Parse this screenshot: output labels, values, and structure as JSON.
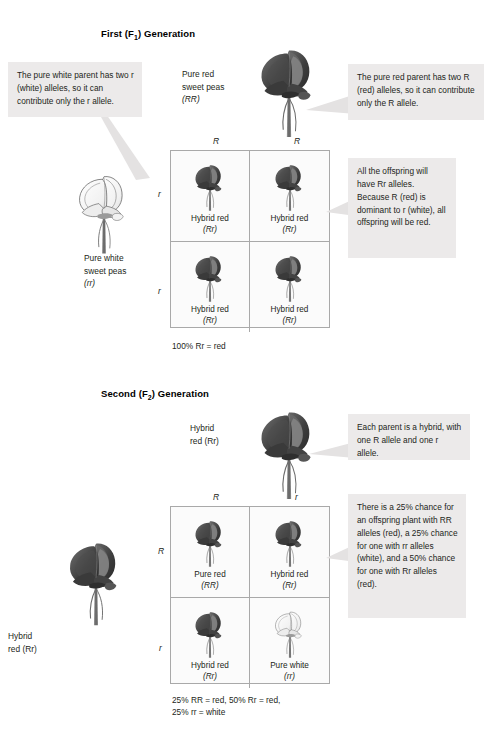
{
  "generations": [
    {
      "id": "f1",
      "title_prefix": "First (F",
      "title_sub": "1",
      "title_suffix": ") Generation",
      "title_full": "First (F1) Generation",
      "top_parent_label_lines": [
        "Pure red",
        "sweet peas",
        "(RR)"
      ],
      "left_parent_label_lines": [
        "Pure white",
        "sweet peas",
        "(rr)"
      ],
      "column_headers": [
        "R",
        "R"
      ],
      "row_headers": [
        "r",
        "r"
      ],
      "cells": [
        {
          "name": "Hybrid red",
          "genotype": "(Rr)",
          "color": "red"
        },
        {
          "name": "Hybrid red",
          "genotype": "(Rr)",
          "color": "red"
        },
        {
          "name": "Hybrid red",
          "genotype": "(Rr)",
          "color": "red"
        },
        {
          "name": "Hybrid red",
          "genotype": "(Rr)",
          "color": "red"
        }
      ],
      "result": "100% Rr = red",
      "callouts": [
        {
          "name": "left-callout",
          "text": "The pure white parent has two r (white) alleles, so it can contribute only the r allele."
        },
        {
          "name": "right-callout",
          "text": "The pure red parent has two R (red) alleles, so it can contribute only the R allele."
        },
        {
          "name": "offspring-callout",
          "text": "All the offspring will have Rr alleles. Because R (red) is dominant to r (white), all offspring will be red."
        }
      ]
    },
    {
      "id": "f2",
      "title_prefix": "Second (F",
      "title_sub": "2",
      "title_suffix": ") Generation",
      "title_full": "Second (F2) Generation",
      "top_parent_label_lines": [
        "Hybrid",
        "red (Rr)"
      ],
      "left_parent_label_lines": [
        "Hybrid",
        "red (Rr)"
      ],
      "column_headers": [
        "R",
        "r"
      ],
      "row_headers": [
        "R",
        "r"
      ],
      "cells": [
        {
          "name": "Pure red",
          "genotype": "(RR)",
          "color": "red"
        },
        {
          "name": "Hybrid red",
          "genotype": "(Rr)",
          "color": "red"
        },
        {
          "name": "Hybrid red",
          "genotype": "(Rr)",
          "color": "red"
        },
        {
          "name": "Pure white",
          "genotype": "(rr)",
          "color": "white"
        }
      ],
      "result_line1": "25% RR = red, 50% Rr = red,",
      "result_line2": "25% rr = white",
      "callouts": [
        {
          "name": "parent-callout",
          "text": "Each parent is a hybrid, with one R allele and one r allele."
        },
        {
          "name": "offspring-callout",
          "text": "There is a 25% chance for an offspring plant with RR alleles (red), a 25% chance for one with rr alleles (white), and a 50% chance for one with Rr alleles (red)."
        }
      ]
    }
  ],
  "colors": {
    "callout_background": "#eceaea",
    "grid_border": "#a9a9a9",
    "grid_background": "#fbfbfb",
    "red_flower": "#4a4a4a",
    "text": "#231f20"
  }
}
